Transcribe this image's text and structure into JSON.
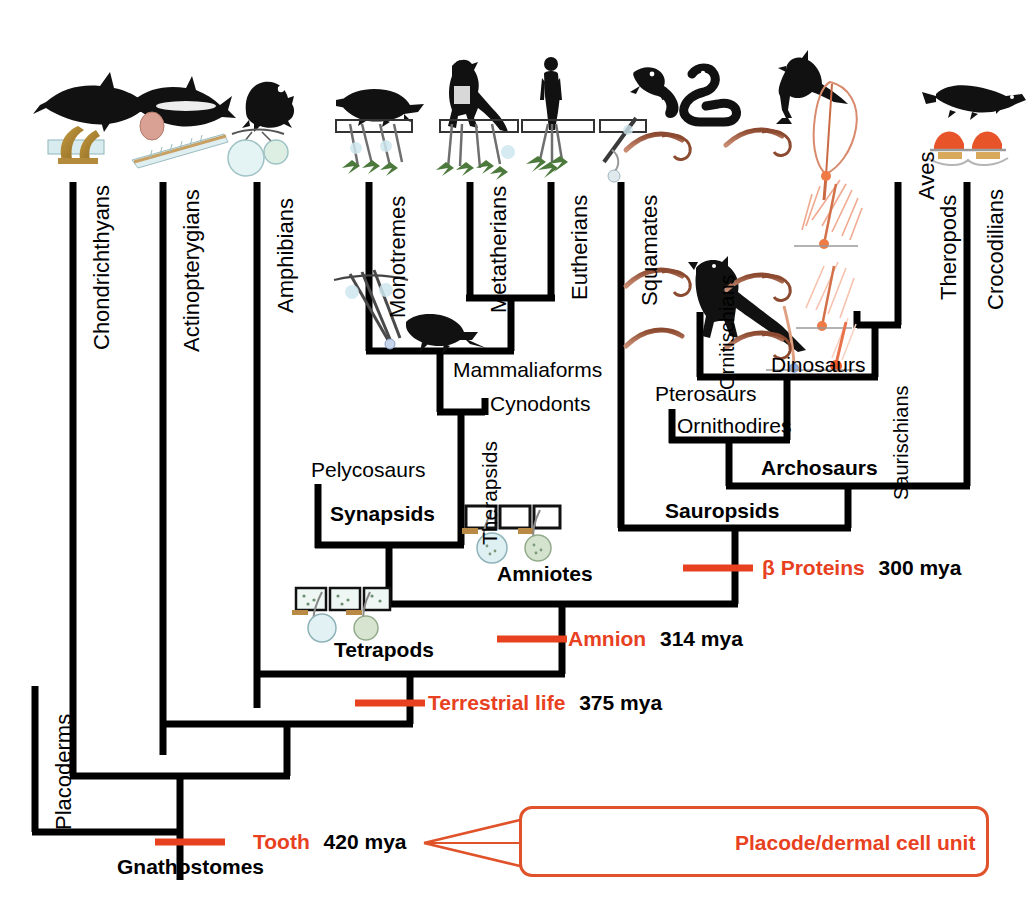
{
  "figure": {
    "type": "phylogenetic-tree",
    "accent_red": "#E8411F",
    "line_color": "#000000",
    "background": "#FFFFFF"
  },
  "tip_labels": [
    {
      "id": "chondrichthyans",
      "label": "Chondrichthyans",
      "x": 73,
      "silhouette": "shark-silhouette"
    },
    {
      "id": "actinopterygians",
      "label": "Actinopterygians",
      "x": 163,
      "silhouette": "fish-silhouette"
    },
    {
      "id": "amphibians",
      "label": "Amphibians",
      "x": 257,
      "silhouette": "frog-silhouette"
    },
    {
      "id": "monotremes",
      "label": "Monotremes",
      "x": 369,
      "silhouette": "platypus-silhouette"
    },
    {
      "id": "metatherians",
      "label": "Metatherians",
      "x": 470,
      "silhouette": "kangaroo-silhouette"
    },
    {
      "id": "eutherians",
      "label": "Eutherians",
      "x": 551,
      "silhouette": "human-silhouette"
    },
    {
      "id": "squamates",
      "label": "Squamates",
      "x": 621,
      "silhouette": "lizard-snake-silhouette"
    },
    {
      "id": "aves",
      "label": "Aves",
      "x": 898,
      "silhouette": "bird-silhouette"
    },
    {
      "id": "theropods",
      "label": "Theropods",
      "x": 920,
      "silhouette": "none"
    },
    {
      "id": "crocodilians",
      "label": "Crocodilians",
      "x": 967,
      "silhouette": "crocodile-silhouette"
    },
    {
      "id": "placoderms",
      "label": "Placoderms",
      "x": 35,
      "silhouette": "none"
    },
    {
      "id": "ornitischians",
      "label": "Ornitischians",
      "x": 700,
      "silhouette": "dinosaur-silhouette"
    },
    {
      "id": "saurischians",
      "label": "Saurischians",
      "x": 898,
      "silhouette": "none"
    }
  ],
  "clade_labels": [
    {
      "id": "mammaliaforms",
      "label": "Mammaliaforms",
      "bold": false,
      "x": 453,
      "y": 370
    },
    {
      "id": "cynodonts",
      "label": "Cynodonts",
      "bold": false,
      "x": 490,
      "y": 404
    },
    {
      "id": "therapsids",
      "label": "Therapsids",
      "bold": false,
      "rotated": true,
      "x": 478,
      "y": 545
    },
    {
      "id": "pelycosaurs",
      "label": "Pelycosaurs",
      "bold": false,
      "x": 311,
      "y": 468
    },
    {
      "id": "synapsids",
      "label": "Synapsids",
      "bold": true,
      "x": 328,
      "y": 513
    },
    {
      "id": "amniotes",
      "label": "Amniotes",
      "bold": true,
      "x": 497,
      "y": 563
    },
    {
      "id": "tetrapods",
      "label": "Tetrapods",
      "bold": true,
      "x": 334,
      "y": 645
    },
    {
      "id": "gnathostomes",
      "label": "Gnathostomes",
      "bold": true,
      "x": 117,
      "y": 861
    },
    {
      "id": "dinosaurs",
      "label": "Dinosaurs",
      "bold": false,
      "x": 771,
      "y": 364
    },
    {
      "id": "pterosaurs",
      "label": "Pterosaurs",
      "bold": false,
      "x": 655,
      "y": 393
    },
    {
      "id": "ornithodires",
      "label": "Ornithodires",
      "bold": false,
      "x": 677,
      "y": 424
    },
    {
      "id": "archosaurs",
      "label": "Archosaurs",
      "bold": true,
      "x": 761,
      "y": 466
    },
    {
      "id": "sauropsids",
      "label": "Sauropsids",
      "bold": true,
      "x": 665,
      "y": 509
    }
  ],
  "annotations": [
    {
      "id": "beta-proteins",
      "event": "β Proteins",
      "age": "300 mya",
      "tick_x": 683,
      "tick_y": 568,
      "text_x": 762,
      "text_y": 557
    },
    {
      "id": "amnion",
      "event": "Amnion",
      "age": "314 mya",
      "tick_x": 497,
      "tick_y": 639,
      "text_x": 568,
      "text_y": 628
    },
    {
      "id": "terrestrial-life",
      "event": "Terrestrial life",
      "age": "375 mya",
      "tick_x": 355,
      "tick_y": 703,
      "text_x": 428,
      "text_y": 692
    },
    {
      "id": "tooth",
      "event": "Tooth",
      "age": "420 mya",
      "tick_x": 155,
      "tick_y": 842,
      "text_x": 253,
      "text_y": 831
    }
  ],
  "inset": {
    "id": "placode-callout",
    "label": "Placode/dermal cell unit",
    "border_color": "#E0522A",
    "diagram": "placode-dermal-cell-unit-diagram"
  },
  "legend_units": {
    "placode_color": "#8a8272",
    "dermal_dot_color": "#4a5fa8"
  }
}
